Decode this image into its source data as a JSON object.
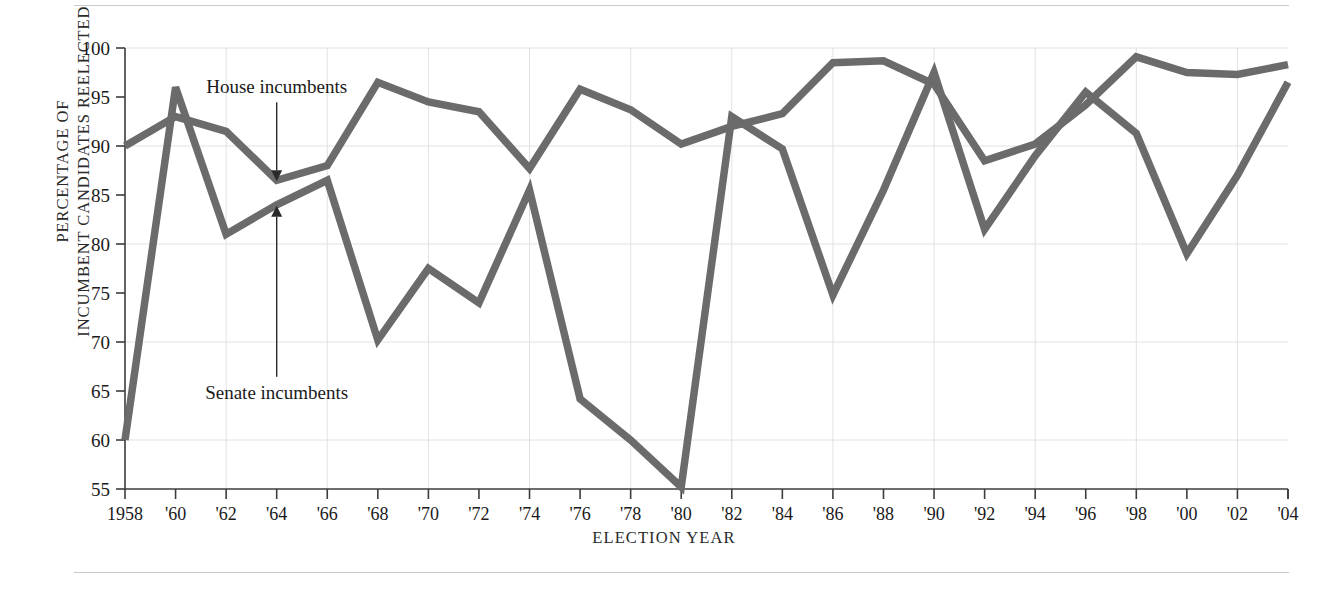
{
  "chart_data": {
    "type": "line",
    "title": "",
    "xlabel": "ELECTION YEAR",
    "ylabel": "PERCENTAGE OF\nINCUMBENT CANDIDATES REELECTED",
    "ylabel_line1": "PERCENTAGE OF",
    "ylabel_line2": "INCUMBENT CANDIDATES REELECTED",
    "grid": true,
    "legend_position": "inline-annotations",
    "ylim": [
      55,
      100
    ],
    "yticks": [
      55,
      60,
      65,
      70,
      75,
      80,
      85,
      90,
      95,
      100
    ],
    "ytick_labels": [
      "55",
      "60",
      "65",
      "70",
      "75",
      "80",
      "85",
      "90",
      "95",
      "100"
    ],
    "gridlines_y": [
      60,
      70,
      80,
      90,
      100
    ],
    "x": [
      1958,
      1960,
      1962,
      1964,
      1966,
      1968,
      1970,
      1972,
      1974,
      1976,
      1978,
      1980,
      1982,
      1984,
      1986,
      1988,
      1990,
      1992,
      1994,
      1996,
      1998,
      2000,
      2002,
      2004
    ],
    "xtick_labels": [
      "1958",
      "'60",
      "'62",
      "'64",
      "'66",
      "'68",
      "'70",
      "'72",
      "'74",
      "'76",
      "'78",
      "'80",
      "'82",
      "'84",
      "'86",
      "'88",
      "'90",
      "'92",
      "'94",
      "'96",
      "'98",
      "'00",
      "'02",
      "'04"
    ],
    "gridlines_x": [
      1962,
      1966,
      1970,
      1974,
      1978,
      1982,
      1986,
      1990,
      1994,
      1998,
      2002
    ],
    "series": [
      {
        "name": "House incumbents",
        "color": "#6b6b6b",
        "values": [
          90.0,
          93.0,
          91.5,
          86.5,
          88.0,
          96.5,
          94.5,
          93.5,
          87.7,
          95.8,
          93.7,
          90.2,
          92.0,
          93.3,
          98.5,
          98.7,
          96.3,
          88.5,
          90.2,
          94.2,
          99.1,
          97.5,
          97.3,
          98.3
        ]
      },
      {
        "name": "Senate incumbents",
        "color": "#6b6b6b",
        "values": [
          60.0,
          96.0,
          81.0,
          84.0,
          86.5,
          70.2,
          77.5,
          74.0,
          85.5,
          64.2,
          60.0,
          55.2,
          93.0,
          89.7,
          74.8,
          85.5,
          97.5,
          81.5,
          89.0,
          95.5,
          91.3,
          79.0,
          87.0,
          96.5
        ]
      }
    ],
    "annotations": [
      {
        "name": "house-incumbents-annotation",
        "label": "House incumbents",
        "x": 1964,
        "y": 86.5,
        "direction": "down"
      },
      {
        "name": "senate-incumbents-annotation",
        "label": "Senate incumbents",
        "x": 1964,
        "y": 84.0,
        "direction": "up"
      }
    ]
  },
  "style": {
    "line_color": "#6b6b6b",
    "axis_color": "#3d3d3d",
    "grid_color": "#e2e2e2",
    "rule_color": "#c9c9c9",
    "text_color": "#1a1a1a",
    "background": "#ffffff"
  }
}
